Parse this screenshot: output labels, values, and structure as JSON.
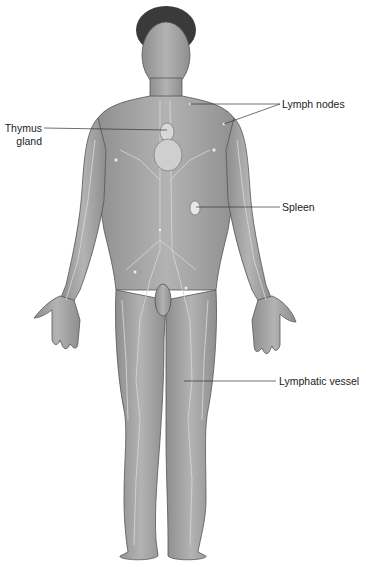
{
  "figure": {
    "colors": {
      "skin": "#a9a9a9",
      "skin_dark": "#8a8a8a",
      "outline": "#555555",
      "vessel": "#d4d4d4",
      "hair": "#3a3a3a",
      "leader_line": "#333333",
      "background": "#ffffff"
    }
  },
  "labels": {
    "lymph_nodes": "Lymph nodes",
    "thymus_line1": "Thymus",
    "thymus_line2": "gland",
    "spleen": "Spleen",
    "lymphatic_vessel": "Lymphatic vessel"
  }
}
